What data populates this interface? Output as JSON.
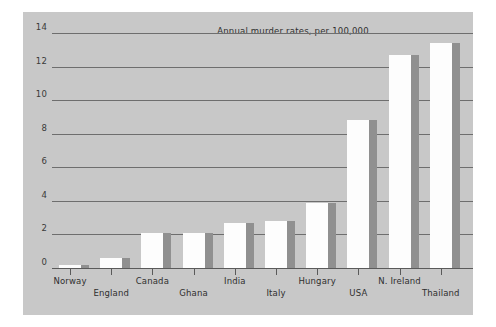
{
  "chart_data": {
    "type": "bar",
    "title": "Annual murder rates, per 100,000",
    "xlabel": "",
    "ylabel": "",
    "ylim": [
      0,
      14
    ],
    "yticks": [
      0,
      2,
      4,
      6,
      8,
      10,
      12,
      14
    ],
    "grid": true,
    "legend": null,
    "categories": [
      "Norway",
      "England",
      "Canada",
      "Ghana",
      "India",
      "Italy",
      "Hungary",
      "USA",
      "N. Ireland",
      "Thailand"
    ],
    "values": [
      0.2,
      0.6,
      2.1,
      2.1,
      2.7,
      2.8,
      3.9,
      8.8,
      12.7,
      13.4
    ],
    "series": [
      {
        "name": "Annual murder rate per 100,000",
        "values": [
          0.2,
          0.6,
          2.1,
          2.1,
          2.7,
          2.8,
          3.9,
          8.8,
          12.7,
          13.4
        ]
      }
    ],
    "style": {
      "bar_face_color": "#fdfdfd",
      "bar_side_color": "#909090",
      "panel_color": "#c8c8c8",
      "grid_color": "#6e6e6e",
      "axis_color": "#5a5a5a",
      "text_color": "#2f2f2f",
      "figure_color": "#ffffff",
      "three_d": true
    },
    "label_rows": [
      [
        "Norway",
        "Canada",
        "India",
        "Hungary",
        "N. Ireland"
      ],
      [
        "England",
        "Ghana",
        "Italy",
        "USA",
        "Thailand"
      ]
    ]
  }
}
